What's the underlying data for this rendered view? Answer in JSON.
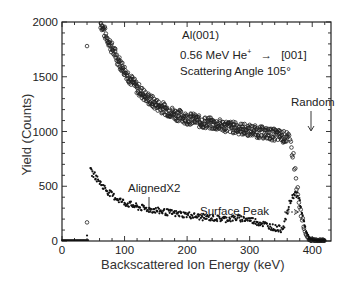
{
  "chart_data": {
    "type": "scatter",
    "title": "",
    "xlabel": "Backscattered Ion Energy (keV)",
    "ylabel": "Yield (Counts)",
    "xlim": [
      0,
      430
    ],
    "ylim": [
      0,
      2000
    ],
    "xticks": [
      0,
      100,
      200,
      300,
      400
    ],
    "yticks": [
      0,
      500,
      1000,
      1500,
      2000
    ],
    "grid": false,
    "legend": "none (inline annotations)",
    "annotations": [
      {
        "text": "Al(001)",
        "position": "top-right"
      },
      {
        "text": "0.56 MeV He+ → [001]",
        "position": "top-right"
      },
      {
        "text": "Scattering Angle 105°",
        "position": "top-right"
      },
      {
        "text": "Random",
        "arrow_to": [
          310,
          1050
        ]
      },
      {
        "text": "AlignedX2",
        "arrow_to": [
          140,
          310
        ]
      },
      {
        "text": "Surface Peak",
        "arrow_to": [
          365,
          400
        ]
      }
    ],
    "series": [
      {
        "name": "Random",
        "marker": "open-circle",
        "x": [
          40,
          62,
          70,
          80,
          90,
          100,
          110,
          120,
          130,
          140,
          150,
          160,
          170,
          180,
          190,
          200,
          210,
          220,
          230,
          240,
          250,
          260,
          270,
          280,
          290,
          300,
          310,
          320,
          330,
          340,
          350,
          360,
          365,
          370,
          375,
          380,
          385,
          390,
          395,
          400,
          410,
          420
        ],
        "values": [
          1780,
          1990,
          1880,
          1760,
          1650,
          1560,
          1470,
          1400,
          1340,
          1290,
          1250,
          1220,
          1190,
          1160,
          1140,
          1120,
          1110,
          1090,
          1080,
          1070,
          1060,
          1050,
          1040,
          1030,
          1020,
          1010,
          1000,
          990,
          980,
          970,
          960,
          940,
          900,
          780,
          520,
          300,
          150,
          50,
          15,
          8,
          5,
          5
        ]
      },
      {
        "name": "AlignedX2",
        "marker": "filled-dot",
        "x": [
          40,
          45,
          50,
          55,
          60,
          70,
          80,
          90,
          100,
          110,
          120,
          130,
          140,
          150,
          160,
          170,
          180,
          190,
          200,
          220,
          240,
          260,
          280,
          300,
          320,
          340,
          350,
          355,
          360,
          365,
          370,
          375,
          380,
          385,
          390,
          395,
          400,
          410,
          420
        ],
        "values": [
          20,
          640,
          610,
          580,
          540,
          470,
          420,
          380,
          350,
          330,
          310,
          300,
          290,
          280,
          270,
          260,
          250,
          245,
          240,
          220,
          210,
          200,
          210,
          195,
          160,
          120,
          110,
          150,
          250,
          360,
          420,
          430,
          360,
          220,
          90,
          25,
          10,
          5,
          5
        ]
      }
    ]
  },
  "axes": {
    "xlabel": "Backscattered Ion Energy (keV)",
    "ylabel": "Yield (Counts)",
    "xtick_labels": [
      "0",
      "100",
      "200",
      "300",
      "400"
    ],
    "ytick_labels": [
      "0",
      "500",
      "1000",
      "1500",
      "2000"
    ]
  },
  "annotations": {
    "line1": "Al(001)",
    "line2_pre": "0.56 MeV He",
    "line2_sup": "+",
    "line2_arrow": "→",
    "line2_post": "[001]",
    "line3": "Scattering Angle 105°",
    "random": "Random",
    "aligned": "AlignedX2",
    "surface_peak": "Surface Peak"
  }
}
